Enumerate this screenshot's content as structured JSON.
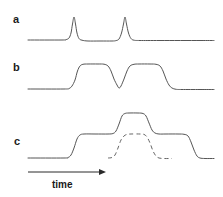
{
  "figure": {
    "width": 223,
    "height": 197,
    "background_color": "#ffffff",
    "line_color": "#555555",
    "axis_color": "#2a2a2a"
  },
  "labels": {
    "trace_a": "a",
    "trace_b": "b",
    "trace_c": "c",
    "axis": "time"
  },
  "chart_data": {
    "type": "line",
    "title": "",
    "xlabel": "time",
    "ylabel": "",
    "grid": false,
    "legend": "none",
    "axis": {
      "arrow_start_x": 28,
      "arrow_end_x": 106,
      "arrow_y": 172,
      "direction": "right",
      "tick_labels": []
    },
    "panels": [
      {
        "name": "a",
        "label": "a",
        "baseline_y": 40,
        "description": "Flat baseline with two narrow sharp peaks",
        "series": [
          {
            "name": "trace-a",
            "style": "solid",
            "points": [
              [
                28,
                40
              ],
              [
                62,
                40
              ],
              [
                66,
                39.6
              ],
              [
                69,
                38
              ],
              [
                71,
                33
              ],
              [
                72.5,
                24
              ],
              [
                74,
                17
              ],
              [
                75.5,
                24
              ],
              [
                77,
                33
              ],
              [
                79,
                38.5
              ],
              [
                82,
                40.2
              ],
              [
                88,
                41
              ],
              [
                100,
                41
              ],
              [
                112,
                41
              ],
              [
                116,
                40.6
              ],
              [
                119,
                39
              ],
              [
                121.5,
                33
              ],
              [
                123.5,
                24
              ],
              [
                125,
                17
              ],
              [
                126.5,
                24
              ],
              [
                128.5,
                33
              ],
              [
                131,
                38.5
              ],
              [
                134,
                40.2
              ],
              [
                140,
                40.5
              ],
              [
                160,
                40.5
              ],
              [
                200,
                40.5
              ],
              [
                214,
                40.5
              ]
            ]
          }
        ]
      },
      {
        "name": "b",
        "label": "b",
        "baseline_y": 89,
        "plateau_y": 64,
        "description": "Broad flat-topped pulse with a deep central notch returning near baseline",
        "series": [
          {
            "name": "trace-b",
            "style": "solid",
            "points": [
              [
                28,
                89
              ],
              [
                64,
                89
              ],
              [
                69,
                88.5
              ],
              [
                72,
                86
              ],
              [
                75,
                80
              ],
              [
                77.5,
                71
              ],
              [
                80,
                66
              ],
              [
                83,
                64.3
              ],
              [
                88,
                64
              ],
              [
                98,
                64
              ],
              [
                104,
                64.2
              ],
              [
                108,
                66
              ],
              [
                111,
                71
              ],
              [
                114,
                79
              ],
              [
                117,
                85
              ],
              [
                119,
                88
              ],
              [
                121,
                86
              ],
              [
                124,
                79
              ],
              [
                127,
                71
              ],
              [
                130,
                66
              ],
              [
                134,
                64.3
              ],
              [
                139,
                64
              ],
              [
                150,
                64
              ],
              [
                156,
                64.3
              ],
              [
                160,
                66
              ],
              [
                163,
                71
              ],
              [
                166,
                79
              ],
              [
                169,
                85
              ],
              [
                172,
                88
              ],
              [
                176,
                89.3
              ],
              [
                182,
                89.5
              ],
              [
                200,
                89.5
              ],
              [
                214,
                89.5
              ]
            ]
          }
        ]
      },
      {
        "name": "c",
        "label": "c",
        "baseline_y": 158,
        "plateau_y": 134,
        "peak_y": 113,
        "dashed_plateau_y": 134,
        "description": "Wide flat pulse with a taller central step; dashed curve shows the underlying component pulse",
        "series": [
          {
            "name": "trace-c-solid",
            "style": "solid",
            "points": [
              [
                28,
                158
              ],
              [
                64,
                158
              ],
              [
                68,
                157.5
              ],
              [
                71,
                155
              ],
              [
                74,
                148
              ],
              [
                77,
                139
              ],
              [
                80,
                135
              ],
              [
                84,
                134
              ],
              [
                95,
                134
              ],
              [
                108,
                134
              ],
              [
                113,
                133.5
              ],
              [
                116,
                131
              ],
              [
                119,
                124
              ],
              [
                122,
                116
              ],
              [
                125,
                113.5
              ],
              [
                129,
                113
              ],
              [
                138,
                113
              ],
              [
                143,
                113.5
              ],
              [
                146,
                116
              ],
              [
                149,
                123
              ],
              [
                152,
                130
              ],
              [
                155,
                133
              ],
              [
                159,
                134
              ],
              [
                166,
                134
              ],
              [
                178,
                134
              ],
              [
                184,
                134.3
              ],
              [
                188,
                136
              ],
              [
                191,
                142
              ],
              [
                194,
                150
              ],
              [
                197,
                156
              ],
              [
                200,
                158
              ],
              [
                205,
                158.5
              ],
              [
                214,
                158.5
              ]
            ]
          },
          {
            "name": "trace-c-dashed",
            "style": "dashed",
            "points": [
              [
                108,
                158
              ],
              [
                112,
                157.5
              ],
              [
                115,
                155
              ],
              [
                118,
                148
              ],
              [
                121,
                140
              ],
              [
                124,
                136
              ],
              [
                127,
                134.4
              ],
              [
                131,
                134
              ],
              [
                140,
                134
              ],
              [
                144,
                134.4
              ],
              [
                147,
                137
              ],
              [
                150,
                143
              ],
              [
                153,
                151
              ],
              [
                156,
                156
              ],
              [
                159,
                158
              ],
              [
                164,
                158.5
              ],
              [
                172,
                158.5
              ]
            ]
          }
        ]
      }
    ]
  }
}
